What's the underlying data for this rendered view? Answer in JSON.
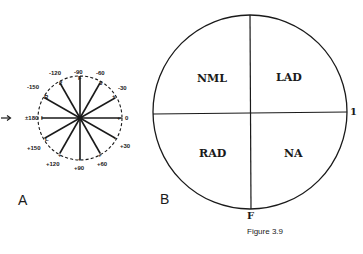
{
  "figure": {
    "caption": "Figure 3.9",
    "panel_a": {
      "label": "A",
      "arrow": "→",
      "degree_labels": {
        "m90": "-90",
        "m60": "-60",
        "m30": "-30",
        "p0": "0",
        "p30": "+30",
        "p60": "+60",
        "p90": "+90",
        "p120": "+120",
        "p150": "+150",
        "pm180": "±180",
        "m150": "-150",
        "m120": "-120"
      },
      "lead_labels": {
        "F": "F",
        "lead3": "3",
        "lead2": "2",
        "R": "R",
        "I": "I",
        "L": "L"
      },
      "pole_marks": {
        "plus": "+",
        "minus": "−"
      }
    },
    "panel_b": {
      "label": "B",
      "quadrants": {
        "upper_left": "NML",
        "upper_right": "LAD",
        "lower_left": "RAD",
        "lower_right": "NA"
      },
      "axis_labels": {
        "right": "1",
        "bottom": "F"
      }
    }
  }
}
